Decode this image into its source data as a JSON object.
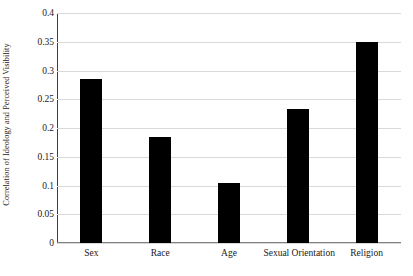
{
  "chart_data": {
    "type": "bar",
    "title": "",
    "xlabel": "",
    "ylabel": "Correlation of Ideology and Perceived Visibility",
    "categories": [
      "Sex",
      "Race",
      "Age",
      "Sexual Orientation",
      "Religion"
    ],
    "values": [
      0.285,
      0.185,
      0.105,
      0.233,
      0.35
    ],
    "ylim": [
      0,
      0.4
    ],
    "ytick_labels": [
      "0",
      "0.05",
      "0.1",
      "0.15",
      "0.2",
      "0.25",
      "0.3",
      "0.35",
      "0.4"
    ],
    "ytick_values": [
      0,
      0.05,
      0.1,
      0.15,
      0.2,
      0.25,
      0.3,
      0.35,
      0.4
    ],
    "grid": "horizontal",
    "legend": "none",
    "bar_color": "#000000",
    "gridline_color": "#d9d9d9",
    "axis_color": "#404040",
    "background_color": "#ffffff"
  }
}
